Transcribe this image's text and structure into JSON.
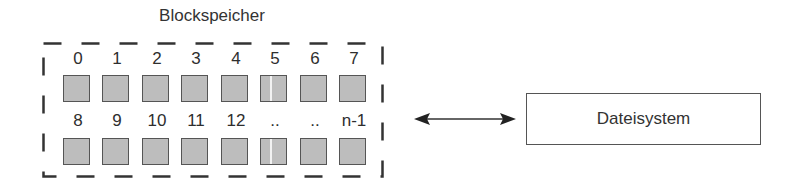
{
  "diagram": {
    "block_storage": {
      "title": "Blockspeicher",
      "rows": [
        {
          "labels": [
            "0",
            "1",
            "2",
            "3",
            "4",
            "5",
            "6",
            "7"
          ]
        },
        {
          "labels": [
            "8",
            "9",
            "10",
            "11",
            "12",
            "..",
            "..",
            "n-1"
          ]
        }
      ]
    },
    "connector": {
      "type": "bidirectional-arrow"
    },
    "file_system": {
      "label": "Dateisystem"
    },
    "colors": {
      "block_fill": "#bdbdbd",
      "block_border": "#555555",
      "line": "#333333"
    }
  }
}
